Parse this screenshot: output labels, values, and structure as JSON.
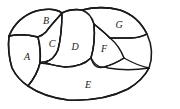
{
  "figure": {
    "stroke_color": "#1a1a1a",
    "fill_color": "#ffffff",
    "background_color": "#ffffff",
    "width": 180,
    "height": 109,
    "regions": [
      {
        "id": "A",
        "label": "A",
        "label_x": 27,
        "label_y": 58,
        "path": "M 9 36 C 8 45 9 58 12 68 C 16 76 22 82 28 86 C 33 80 38 72 40 63 C 41 53 40 44 38 37 C 30 35 18 34 9 36 Z"
      },
      {
        "id": "B",
        "label": "B",
        "label_x": 46,
        "label_y": 22,
        "path": "M 9 36 C 14 24 24 15 36 11 C 47 8 57 9 62 13 C 57 19 50 26 46 32 C 43 35 41 36 38 37 C 30 35 18 34 9 36 Z"
      },
      {
        "id": "C",
        "label": "C",
        "label_x": 52,
        "label_y": 45,
        "path": "M 38 37 C 41 36 43 35 46 32 C 50 26 57 19 62 13 C 62 24 61 38 58 50 C 55 57 50 61 45 62 C 42 62 40 62 40 63 C 41 53 40 44 38 37 Z"
      },
      {
        "id": "D",
        "label": "D",
        "label_x": 75,
        "label_y": 48,
        "path": "M 62 13 C 68 10 75 9 82 10 C 88 12 92 17 94 24 C 95 35 94 48 91 58 C 85 64 75 67 65 67 C 55 66 48 64 45 62 C 50 61 55 57 58 50 C 61 38 62 24 62 13 Z"
      },
      {
        "id": "E",
        "label": "E",
        "label_x": 88,
        "label_y": 86,
        "path": "M 28 86 C 38 93 52 98 68 100 C 90 101 112 97 128 89 C 138 83 145 76 149 68 C 136 70 120 70 108 68 C 100 66 95 62 91 58 C 85 64 75 67 65 67 C 55 66 48 64 45 62 C 43 62 41 62 40 63 C 38 72 33 80 28 86 Z"
      },
      {
        "id": "F",
        "label": "F",
        "label_x": 104,
        "label_y": 50,
        "path": "M 94 24 C 99 28 105 33 110 38 C 116 43 121 50 124 58 C 118 62 111 65 104 67 C 99 68 94 68 91 58 C 94 48 95 35 94 24 Z"
      },
      {
        "id": "G",
        "label": "G",
        "label_x": 119,
        "label_y": 26,
        "path": "M 82 10 C 94 7 108 7 120 10 C 132 14 141 22 147 34 C 143 36 137 38 131 38 C 122 38 116 38 110 38 C 105 33 99 28 94 24 C 92 17 88 12 82 10 Z"
      }
    ],
    "outer_outline": "M 9 36 C 14 24 24 15 36 11 C 47 8 57 9 62 13 C 68 10 75 9 82 10 C 94 7 108 7 120 10 C 132 14 141 22 147 34 C 152 45 153 57 149 68 C 145 76 138 83 128 89 C 112 97 90 101 68 100 C 52 98 38 93 28 86 C 22 82 16 76 12 68 C 9 58 8 45 9 36 Z",
    "dividers": [
      {
        "id": "divider-a-b",
        "path": "M 9 36 C 18 34 30 35 38 37"
      },
      {
        "id": "divider-a-cd",
        "path": "M 38 37 C 41 53 40 63 40 63"
      },
      {
        "id": "divider-b-c",
        "path": "M 62 13 C 57 19 50 26 46 32 C 43 35 41 36 38 37"
      },
      {
        "id": "divider-c-d",
        "path": "M 62 13 C 62 24 61 38 58 50 C 55 57 50 61 45 62"
      },
      {
        "id": "divider-d-e",
        "path": "M 40 63 C 46 63 55 66 65 67 C 75 67 85 64 91 58"
      },
      {
        "id": "divider-a-e",
        "path": "M 28 86 C 33 80 38 72 40 63"
      },
      {
        "id": "divider-d-f",
        "path": "M 94 24 C 95 35 94 48 91 58"
      },
      {
        "id": "divider-f-g",
        "path": "M 94 24 C 99 28 105 33 110 38 C 116 38 122 38 131 38 C 137 38 143 36 147 34"
      },
      {
        "id": "divider-f-e",
        "path": "M 91 58 C 95 65 99 68 104 67 C 111 65 118 62 124 58"
      },
      {
        "id": "divider-g-e",
        "path": "M 124 58 C 131 62 140 66 149 68"
      }
    ]
  }
}
